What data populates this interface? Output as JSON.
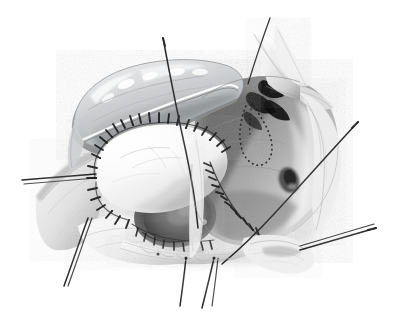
{
  "figure": {
    "kind": "medical-surgical-illustration",
    "style": "grayscale pen-and-ink with wash shading",
    "background_color": "#ffffff",
    "width": 395,
    "height": 326,
    "title": "Open surgical field with sutured tissue flap and retraction stitches"
  },
  "palette": {
    "paper_white": "#ffffff",
    "highlight": "#fbfbfb",
    "light_gray": "#e2e2e2",
    "mid_gray": "#b4b4b4",
    "tone_gray": "#8e8e8e",
    "deep_gray": "#5a5a5a",
    "shadow": "#303030",
    "near_black": "#121212",
    "suture_ink": "#1c1c1c",
    "cool_tint": "#d7dadd"
  },
  "structures": [
    {
      "id": "upper-flap",
      "label": "Retracted tissue flap",
      "position": "upper left",
      "note": "Scalloped superior border with specular highlights, reflected upward and to the right"
    },
    {
      "id": "pale-lobe",
      "label": "Pale lobular structure",
      "position": "left of centre",
      "note": "Bright near-white body with faint surface vessels, encircled by interrupted sutures"
    },
    {
      "id": "central-cavity",
      "label": "Cavity orifice",
      "position": "centre",
      "note": "Dark recessed opening with a rounded inner wall"
    },
    {
      "id": "right-wall",
      "label": "Lateral tissue wall",
      "position": "right",
      "note": "Broad shaded wall carrying a curved suture line and a small depression"
    },
    {
      "id": "apex-flap",
      "label": "Superior pointed flap",
      "position": "top right",
      "note": "Thin pale retracted leaflet forming a pointed apex"
    },
    {
      "id": "inferior-ridge",
      "label": "Inferior tissue ridge",
      "position": "bottom centre",
      "note": "Scalloped pale ridge with suture anchor points"
    },
    {
      "id": "dark-recesses",
      "label": "Deep shadow recesses",
      "position": "upper right of centre",
      "note": "Two to three near-black triangular voids"
    }
  ],
  "markings": [
    {
      "id": "dotted-outline",
      "label": "Dotted teardrop marking",
      "position": "upper right wall",
      "note": "Stippled loop outlining a planned incision or landmark"
    }
  ],
  "suture_lines": [
    {
      "id": "lobe-suture-arc",
      "label": "Interrupted suture row around pale lobe",
      "stitch_count": 26,
      "note": "Dense short perpendicular stitches along the superior and left border"
    },
    {
      "id": "right-fold-suture",
      "label": "Curved suture line on right fold",
      "stitch_count": 20,
      "note": "Follows the medial edge of the lateral wall downward"
    },
    {
      "id": "inferior-suture",
      "label": "Inferior border stitches",
      "stitch_count": 14,
      "note": "Runs along the lower margin of the cavity"
    }
  ],
  "retraction_sutures": [
    {
      "id": "stay-suture-left",
      "label": "Left stay suture",
      "direction": "left",
      "strands": 2
    },
    {
      "id": "stay-suture-top",
      "label": "Superior stay suture",
      "direction": "up",
      "strands": 1
    },
    {
      "id": "stay-suture-upper-right",
      "label": "Upper right stay suture",
      "direction": "upper right",
      "strands": 1
    },
    {
      "id": "stay-suture-right",
      "label": "Right stay suture",
      "direction": "right",
      "strands": 2
    },
    {
      "id": "stay-suture-lower-left",
      "label": "Lower left stay suture",
      "direction": "down left",
      "strands": 2
    },
    {
      "id": "stay-suture-bottom",
      "label": "Inferior stay sutures",
      "direction": "down",
      "strands": 3
    },
    {
      "id": "stay-suture-diagonal",
      "label": "Long oblique stay suture",
      "direction": "upper right to lower left",
      "strands": 1
    }
  ]
}
